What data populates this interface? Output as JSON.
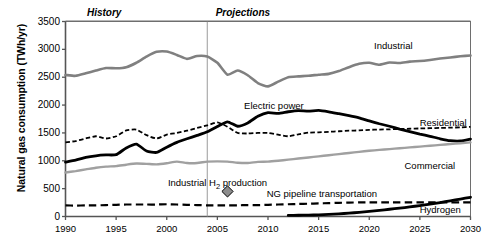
{
  "chart_data": {
    "type": "line",
    "title": "",
    "xlabel": "",
    "ylabel": "Natural gas consumption (TWh/yr)",
    "xlim": [
      1990,
      2030
    ],
    "ylim": [
      0,
      3500
    ],
    "ytick_labels": [
      "0",
      "500",
      "1000",
      "1500",
      "2000",
      "2500",
      "3000",
      "3500"
    ],
    "ytick_values": [
      0,
      500,
      1000,
      1500,
      2000,
      2500,
      3000,
      3500
    ],
    "xtick_labels": [
      "1990",
      "1995",
      "2000",
      "2005",
      "2010",
      "2015",
      "2020",
      "2025",
      "2030"
    ],
    "xtick_values": [
      1990,
      1995,
      2000,
      2005,
      2010,
      2015,
      2020,
      2025,
      2030
    ],
    "grid": false,
    "legend_position": "inline-annotations",
    "history_projection_split": 2004,
    "annotations": [
      {
        "name": "history",
        "text": "History",
        "x": 1993.8,
        "y": 3660,
        "style": "bold-italic"
      },
      {
        "name": "projections",
        "text": "Projections",
        "x": 2007.5,
        "y": 3660,
        "style": "bold-italic"
      },
      {
        "name": "industrial-label",
        "text": "Industrial",
        "x": 2022.4,
        "y": 3065,
        "style": "plain"
      },
      {
        "name": "electric-power-label",
        "text": "Electric power",
        "x": 2010.6,
        "y": 1975,
        "style": "plain"
      },
      {
        "name": "residential-label",
        "text": "Residential",
        "x": 2027.3,
        "y": 1680,
        "style": "plain"
      },
      {
        "name": "commercial-label",
        "text": "Commercial",
        "x": 2026.0,
        "y": 900,
        "style": "plain"
      },
      {
        "name": "industrial-h2-production-label",
        "text": "Industrial H2 production",
        "x": 2005.0,
        "y": 610,
        "style": "plain"
      },
      {
        "name": "ng-pipeline-transportation-label",
        "text": "NG pipeline transportation",
        "x": 2015.3,
        "y": 400,
        "style": "plain"
      },
      {
        "name": "hydrogen-label",
        "text": "Hydrogen",
        "x": 2027.0,
        "y": 120,
        "style": "plain"
      }
    ],
    "markers": [
      {
        "name": "industrial-h2-production-marker",
        "shape": "diamond",
        "x": 2006.0,
        "y": 450,
        "fill": "#8c8c8c",
        "stroke": "#000000",
        "label": "Industrial H2 production"
      }
    ],
    "series": [
      {
        "name": "Industrial",
        "color": "#808080",
        "style": "solid",
        "width": 2.6,
        "x": [
          1990,
          1991,
          1992,
          1993,
          1994,
          1995,
          1996,
          1997,
          1998,
          1999,
          2000,
          2001,
          2002,
          2003,
          2004,
          2005,
          2006,
          2007,
          2008,
          2009,
          2010,
          2011,
          2012,
          2013,
          2014,
          2015,
          2016,
          2017,
          2018,
          2019,
          2020,
          2021,
          2022,
          2023,
          2024,
          2025,
          2026,
          2027,
          2028,
          2029,
          2030
        ],
        "values": [
          2540,
          2525,
          2570,
          2620,
          2665,
          2660,
          2680,
          2760,
          2870,
          2955,
          2960,
          2900,
          2830,
          2880,
          2870,
          2760,
          2545,
          2620,
          2535,
          2395,
          2335,
          2420,
          2500,
          2515,
          2525,
          2545,
          2560,
          2610,
          2680,
          2740,
          2760,
          2725,
          2765,
          2755,
          2780,
          2790,
          2810,
          2835,
          2855,
          2875,
          2890
        ]
      },
      {
        "name": "Electric power",
        "color": "#000000",
        "style": "solid",
        "width": 2.8,
        "x": [
          1990,
          1991,
          1992,
          1993,
          1994,
          1995,
          1996,
          1997,
          1998,
          1999,
          2000,
          2001,
          2002,
          2003,
          2004,
          2005,
          2006,
          2007,
          2008,
          2009,
          2010,
          2011,
          2012,
          2013,
          2014,
          2015,
          2016,
          2017,
          2018,
          2019,
          2020,
          2021,
          2022,
          2023,
          2024,
          2025,
          2026,
          2027,
          2028,
          2029,
          2030
        ],
        "values": [
          975,
          1010,
          1060,
          1090,
          1105,
          1110,
          1230,
          1300,
          1175,
          1150,
          1245,
          1330,
          1395,
          1455,
          1520,
          1615,
          1700,
          1620,
          1680,
          1800,
          1865,
          1850,
          1880,
          1900,
          1890,
          1905,
          1880,
          1845,
          1810,
          1770,
          1715,
          1665,
          1620,
          1570,
          1525,
          1480,
          1440,
          1395,
          1360,
          1355,
          1390
        ]
      },
      {
        "name": "Residential",
        "color": "#000000",
        "style": "dashed-fine",
        "width": 1.8,
        "x": [
          1990,
          1991,
          1992,
          1993,
          1994,
          1995,
          1996,
          1997,
          1998,
          1999,
          2000,
          2001,
          2002,
          2003,
          2004,
          2005,
          2006,
          2007,
          2008,
          2009,
          2010,
          2011,
          2012,
          2013,
          2014,
          2015,
          2016,
          2017,
          2018,
          2019,
          2020,
          2021,
          2022,
          2023,
          2024,
          2025,
          2026,
          2027,
          2028,
          2029,
          2030
        ],
        "values": [
          1330,
          1355,
          1400,
          1440,
          1400,
          1440,
          1545,
          1560,
          1460,
          1400,
          1470,
          1500,
          1540,
          1590,
          1635,
          1690,
          1610,
          1500,
          1490,
          1500,
          1500,
          1470,
          1440,
          1475,
          1505,
          1510,
          1520,
          1530,
          1540,
          1545,
          1555,
          1560,
          1565,
          1570,
          1575,
          1580,
          1585,
          1590,
          1595,
          1600,
          1610
        ]
      },
      {
        "name": "Commercial",
        "color": "#a0a0a0",
        "style": "solid",
        "width": 2.4,
        "x": [
          1990,
          1991,
          1992,
          1993,
          1994,
          1995,
          1996,
          1997,
          1998,
          1999,
          2000,
          2001,
          2002,
          2003,
          2004,
          2005,
          2006,
          2007,
          2008,
          2009,
          2010,
          2011,
          2012,
          2013,
          2014,
          2015,
          2016,
          2017,
          2018,
          2019,
          2020,
          2021,
          2022,
          2023,
          2024,
          2025,
          2026,
          2027,
          2028,
          2029,
          2030
        ],
        "values": [
          790,
          815,
          845,
          875,
          895,
          905,
          930,
          950,
          945,
          935,
          955,
          985,
          960,
          960,
          985,
          990,
          985,
          965,
          960,
          980,
          985,
          1000,
          1020,
          1040,
          1060,
          1080,
          1100,
          1120,
          1140,
          1160,
          1180,
          1195,
          1210,
          1225,
          1240,
          1255,
          1270,
          1285,
          1300,
          1315,
          1330
        ]
      },
      {
        "name": "NG pipeline transportation",
        "color": "#000000",
        "style": "dashed-coarse",
        "width": 2.2,
        "x": [
          1990,
          1991,
          1992,
          1993,
          1994,
          1995,
          1996,
          1997,
          1998,
          1999,
          2000,
          2001,
          2002,
          2003,
          2004,
          2005,
          2006,
          2007,
          2008,
          2009,
          2010,
          2011,
          2012,
          2013,
          2014,
          2015,
          2016,
          2017,
          2018,
          2019,
          2020,
          2021,
          2022,
          2023,
          2024,
          2025,
          2026,
          2027,
          2028,
          2029,
          2030
        ],
        "values": [
          200,
          195,
          200,
          200,
          205,
          210,
          215,
          215,
          215,
          215,
          220,
          215,
          210,
          205,
          200,
          200,
          200,
          200,
          205,
          205,
          210,
          215,
          220,
          225,
          230,
          235,
          240,
          245,
          250,
          252,
          255,
          255,
          255,
          255,
          255,
          255,
          255,
          255,
          255,
          255,
          255
        ]
      },
      {
        "name": "Hydrogen",
        "color": "#000000",
        "style": "solid",
        "width": 2.8,
        "x": [
          2012,
          2013,
          2014,
          2015,
          2016,
          2017,
          2018,
          2019,
          2020,
          2021,
          2022,
          2023,
          2024,
          2025,
          2026,
          2027,
          2028,
          2029,
          2030
        ],
        "values": [
          20,
          22,
          25,
          30,
          38,
          48,
          60,
          75,
          92,
          110,
          130,
          150,
          172,
          196,
          222,
          250,
          282,
          312,
          345
        ]
      }
    ]
  },
  "axis": {
    "ylabel": "Natural gas consumption (TWh/yr)"
  }
}
